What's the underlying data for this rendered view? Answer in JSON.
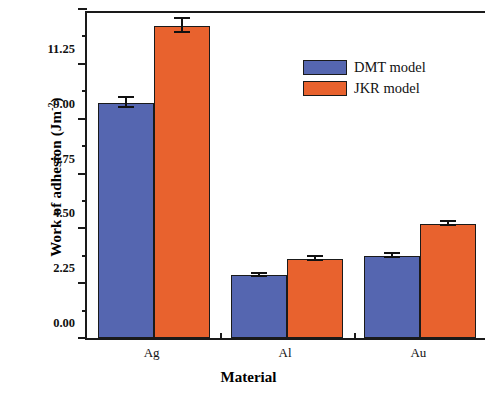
{
  "chart_data": {
    "type": "bar",
    "title": "",
    "xlabel": "Material",
    "ylabel": "Work of adhesion (Jm",
    "ylabel_sup": "-2",
    "ylabel_close": ")",
    "categories": [
      "Ag",
      "Al",
      "Au"
    ],
    "series": [
      {
        "name": "DMT model",
        "color": "#5566b0",
        "values": [
          9.64,
          2.58,
          3.37
        ],
        "errors": [
          0.22,
          0.06,
          0.07
        ]
      },
      {
        "name": "JKR model",
        "color": "#e8622e",
        "values": [
          12.8,
          3.24,
          4.68
        ],
        "errors": [
          0.3,
          0.07,
          0.09
        ]
      }
    ],
    "ylim": [
      0.0,
      13.5
    ],
    "ytick_labels": [
      "0.00",
      "2.25",
      "4.50",
      "6.75",
      "9.00",
      "11.25",
      "13.50"
    ],
    "ytick_values": [
      0.0,
      2.25,
      4.5,
      6.75,
      9.0,
      11.25,
      13.5
    ],
    "yminor_values": [
      1.125,
      3.375,
      5.625,
      7.875,
      10.125,
      12.375
    ],
    "grid": false,
    "legend_position": "upper right",
    "legend": [
      "DMT model",
      "JKR model"
    ]
  }
}
